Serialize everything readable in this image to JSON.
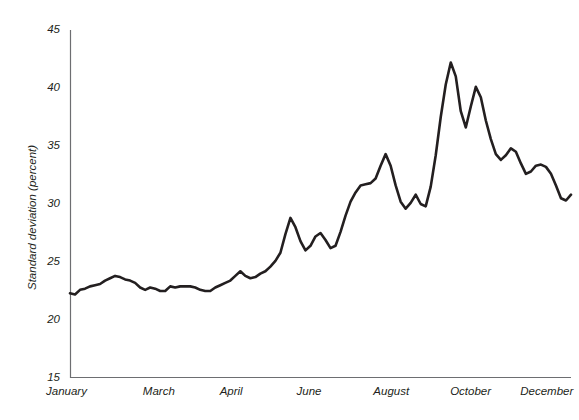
{
  "chart_data": {
    "type": "line",
    "title": "",
    "subtitle": "",
    "xlabel": "",
    "ylabel": "Standard deviation (percent)",
    "ylim": [
      15,
      45
    ],
    "yticks": [
      15,
      20,
      25,
      30,
      35,
      40,
      45
    ],
    "ytick_labels": [
      "15",
      "20",
      "25",
      "30",
      "35",
      "40",
      "45"
    ],
    "xtick_labels": [
      "January",
      "March",
      "April",
      "June",
      "August",
      "October",
      "December"
    ],
    "xtick_positions": [
      0,
      58,
      104,
      150,
      196,
      242,
      284
    ],
    "grid": false,
    "legend": null,
    "annotations": [],
    "line_color": "#231f20",
    "axis_color": "#6d6e71",
    "series": [
      {
        "name": "Standard deviation",
        "x": [
          0,
          3,
          6,
          9,
          12,
          15,
          18,
          21,
          24,
          27,
          30,
          33,
          36,
          39,
          42,
          45,
          48,
          51,
          54,
          57,
          60,
          63,
          66,
          69,
          72,
          75,
          78,
          81,
          84,
          87,
          90,
          93,
          96,
          99,
          102,
          105,
          108,
          111,
          114,
          117,
          120,
          123,
          126,
          129,
          132,
          135,
          138,
          141,
          144,
          147,
          150,
          153,
          156,
          159,
          162,
          165,
          168,
          171,
          174,
          177,
          180,
          183,
          186,
          189,
          192,
          195,
          198,
          201,
          204,
          207,
          210,
          213,
          216,
          219,
          222,
          225,
          228,
          231,
          234,
          237,
          240,
          243,
          246,
          249,
          252,
          255,
          258,
          261,
          264,
          267,
          270,
          273,
          276,
          279,
          282,
          285,
          288,
          291,
          294,
          297,
          300
        ],
        "values": [
          22.3,
          22.2,
          22.6,
          22.7,
          22.9,
          23.0,
          23.1,
          23.4,
          23.6,
          23.8,
          23.7,
          23.5,
          23.4,
          23.2,
          22.8,
          22.6,
          22.8,
          22.7,
          22.5,
          22.5,
          22.9,
          22.8,
          22.9,
          22.9,
          22.9,
          22.8,
          22.6,
          22.5,
          22.5,
          22.8,
          23.0,
          23.2,
          23.4,
          23.8,
          24.2,
          23.8,
          23.6,
          23.7,
          24.0,
          24.2,
          24.6,
          25.1,
          25.8,
          27.4,
          28.8,
          28.0,
          26.8,
          26.0,
          26.4,
          27.2,
          27.5,
          26.9,
          26.2,
          26.4,
          27.6,
          29.0,
          30.2,
          31.0,
          31.6,
          31.7,
          31.8,
          32.2,
          33.3,
          34.3,
          33.3,
          31.6,
          30.2,
          29.6,
          30.1,
          30.8,
          30.0,
          29.8,
          31.5,
          34.2,
          37.5,
          40.3,
          42.2,
          41.0,
          38.0,
          36.6,
          38.4,
          40.1,
          39.2,
          37.2,
          35.6,
          34.3,
          33.8,
          34.2,
          34.8,
          34.5,
          33.5,
          32.6,
          32.8,
          33.3,
          33.4,
          33.2,
          32.6,
          31.6,
          30.5,
          30.3,
          30.8
        ]
      }
    ]
  }
}
